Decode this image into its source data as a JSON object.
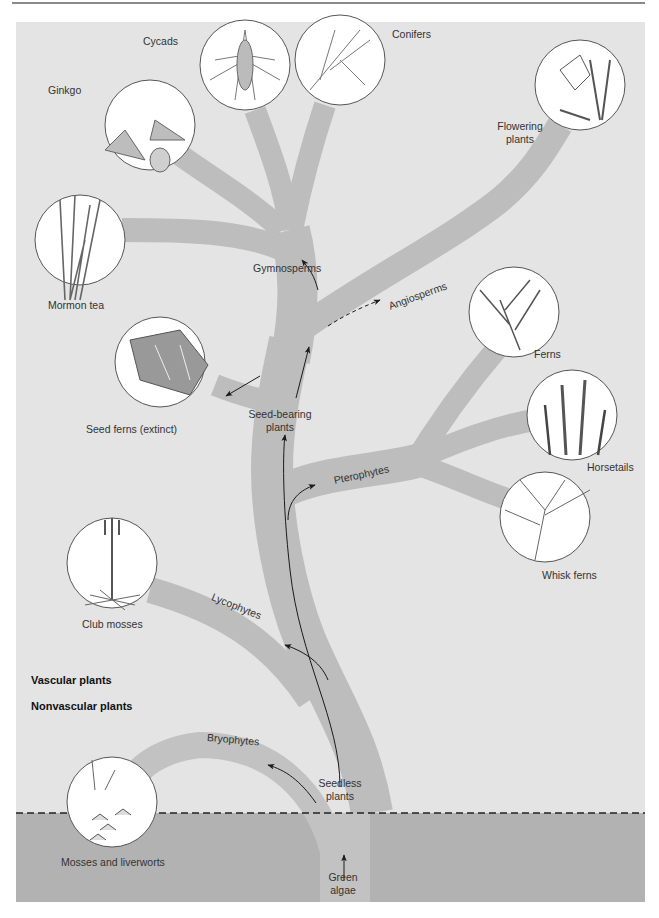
{
  "diagram": {
    "type": "phylogenetic-tree",
    "title_region": {
      "upper": "Vascular plants",
      "lower": "Nonvascular plants"
    },
    "colors": {
      "upper_bg": "#e4e4e4",
      "lower_bg": "#b2b2b2",
      "branch_upper": "#bdbdbd",
      "branch_lower": "#c2c2c2",
      "arrow": "#1a1a1a",
      "divider": "#222222"
    },
    "clades": {
      "root": "Green algae",
      "seedless": "Seedless plants",
      "bryophytes": "Bryophytes",
      "lycophytes": "Lycophytes",
      "pterophytes": "Pterophytes",
      "seed_bearing": "Seed-bearing plants",
      "gymnosperms": "Gymnosperms",
      "angiosperms": "Angiosperms"
    },
    "clade_lines": {
      "root": [
        "Green",
        "algae"
      ],
      "seedless": [
        "Seedless",
        "plants"
      ],
      "seed_bearing": [
        "Seed-bearing",
        "plants"
      ]
    },
    "taxa": [
      {
        "id": "ginkgo",
        "label": "Ginkgo",
        "group": "Gymnosperms"
      },
      {
        "id": "cycads",
        "label": "Cycads",
        "group": "Gymnosperms"
      },
      {
        "id": "conifers",
        "label": "Conifers",
        "group": "Gymnosperms"
      },
      {
        "id": "mormon-tea",
        "label": "Mormon tea",
        "group": "Gymnosperms"
      },
      {
        "id": "flowering-plants",
        "label": "Flowering plants",
        "lines": [
          "Flowering",
          "plants"
        ],
        "group": "Angiosperms"
      },
      {
        "id": "seed-ferns",
        "label": "Seed ferns (extinct)",
        "group": "Seed-bearing plants"
      },
      {
        "id": "ferns",
        "label": "Ferns",
        "group": "Pterophytes"
      },
      {
        "id": "horsetails",
        "label": "Horsetails",
        "group": "Pterophytes"
      },
      {
        "id": "whisk-ferns",
        "label": "Whisk ferns",
        "group": "Pterophytes"
      },
      {
        "id": "club-mosses",
        "label": "Club mosses",
        "group": "Lycophytes"
      },
      {
        "id": "mosses-liverworts",
        "label": "Mosses and liverworts",
        "group": "Bryophytes"
      }
    ]
  }
}
